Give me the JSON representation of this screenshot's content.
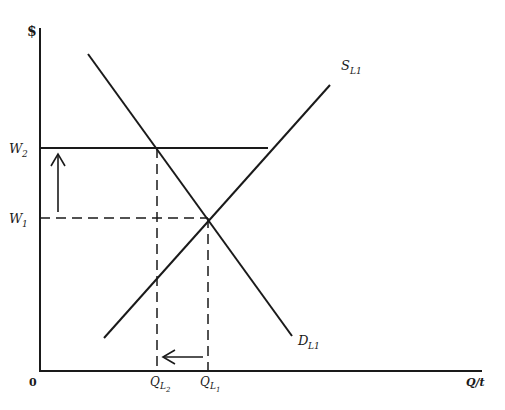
{
  "diagram": {
    "type": "supply-demand labor market (minimum wage / price floor)",
    "y_axis_label": "$",
    "x_axis_label": "Q/t",
    "origin_label": "0",
    "wage_levels": [
      {
        "label": "W",
        "sub": "2",
        "y": 148
      },
      {
        "label": "W",
        "sub": "1",
        "y": 218
      }
    ],
    "quantity_levels": [
      {
        "label": "Q",
        "sub1": "L",
        "sub2": "2",
        "x": 157
      },
      {
        "label": "Q",
        "sub1": "L",
        "sub2": "1",
        "x": 208
      }
    ],
    "curves": [
      {
        "name": "supply",
        "label": "S",
        "sub": "L1",
        "from": [
          104,
          338
        ],
        "to": [
          330,
          85
        ]
      },
      {
        "name": "demand",
        "label": "D",
        "sub": "L1",
        "from": [
          88,
          54
        ],
        "to": [
          292,
          336
        ]
      }
    ],
    "arrows": [
      {
        "name": "wage-increase-arrow",
        "direction": "up",
        "from": [
          58,
          212
        ],
        "to": [
          58,
          154
        ]
      },
      {
        "name": "quantity-decrease-arrow",
        "direction": "left",
        "from": [
          203,
          357
        ],
        "to": [
          163,
          357
        ]
      }
    ],
    "colors": {
      "ink": "#1a1a1a",
      "background": "#ffffff"
    }
  }
}
